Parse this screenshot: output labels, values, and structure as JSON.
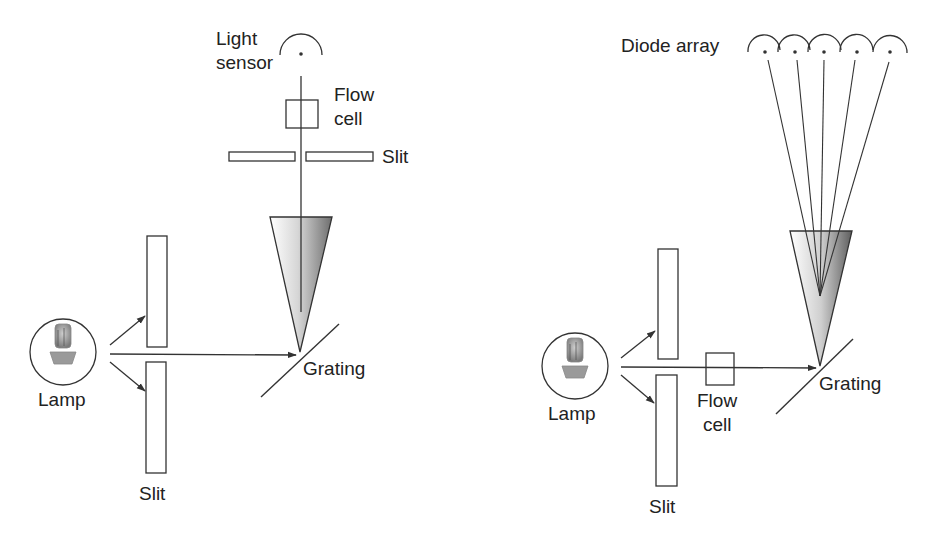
{
  "left_diagram": {
    "title": "Single-wavelength UV detector",
    "labels": {
      "light_sensor_line1": "Light",
      "light_sensor_line2": "sensor",
      "flow_cell_line1": "Flow",
      "flow_cell_line2": "cell",
      "top_slit": "Slit",
      "lamp": "Lamp",
      "slit": "Slit",
      "grating": "Grating"
    }
  },
  "right_diagram": {
    "title": "Diode-array detector",
    "labels": {
      "diode_array": "Diode array",
      "lamp": "Lamp",
      "slit": "Slit",
      "flow_cell_line1": "Flow",
      "flow_cell_line2": "cell",
      "grating": "Grating"
    },
    "diode_count": 5
  },
  "colors": {
    "stroke": "#333333",
    "text": "#222222",
    "cone_light": "#ffffff",
    "cone_dark": "#6e6e6e",
    "background": "#ffffff"
  }
}
